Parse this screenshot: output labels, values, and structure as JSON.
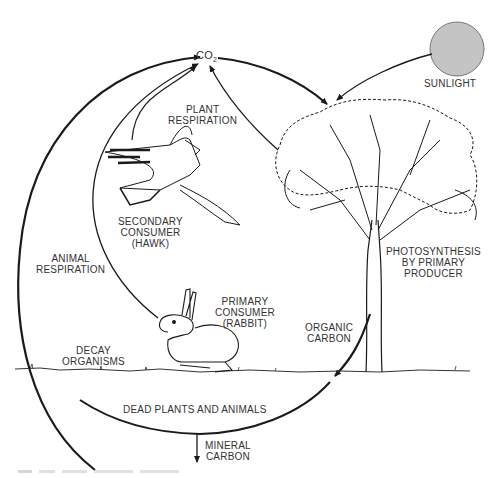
{
  "diagram": {
    "type": "carbon-cycle",
    "nodes": {
      "co2": {
        "label": "CO",
        "subscript": "2"
      },
      "sunlight": {
        "label": "SUNLIGHT",
        "color": "#c4c4c4"
      },
      "plant_respiration": {
        "line1": "PLANT",
        "line2": "RESPIRATION"
      },
      "hawk": {
        "line1": "SECONDARY",
        "line2": "CONSUMER",
        "line3": "(HAWK)"
      },
      "animal_respiration": {
        "line1": "ANIMAL",
        "line2": "RESPIRATION"
      },
      "rabbit": {
        "line1": "PRIMARY",
        "line2": "CONSUMER",
        "line3": "(RABBIT)"
      },
      "photosynthesis": {
        "line1": "PHOTOSYNTHESIS",
        "line2": "BY PRIMARY",
        "line3": "PRODUCER"
      },
      "organic_carbon": {
        "line1": "ORGANIC",
        "line2": "CARBON"
      },
      "decay": {
        "line1": "DECAY",
        "line2": "ORGANISMS"
      },
      "dead": {
        "label": "DEAD PLANTS AND ANIMALS"
      },
      "mineral_carbon": {
        "line1": "MINERAL",
        "line2": "CARBON"
      }
    },
    "edges": [
      {
        "from": "decay",
        "to": "co2",
        "label": ""
      },
      {
        "from": "hawk",
        "to": "co2",
        "label": ""
      },
      {
        "from": "rabbit",
        "to": "co2",
        "label": "ANIMAL RESPIRATION"
      },
      {
        "from": "tree",
        "to": "co2",
        "label": "PLANT RESPIRATION"
      },
      {
        "from": "co2",
        "to": "tree",
        "label": ""
      },
      {
        "from": "sunlight",
        "to": "tree",
        "label": ""
      },
      {
        "from": "tree",
        "to": "ground",
        "label": "ORGANIC CARBON"
      },
      {
        "from": "ground",
        "to": "decay",
        "label": "DEAD PLANTS AND ANIMALS"
      },
      {
        "from": "cycle",
        "to": "mineral",
        "label": "MINERAL CARBON"
      }
    ],
    "colors": {
      "line": "#1a1a1a",
      "sun": "#c4c4c4",
      "text": "#333333"
    }
  }
}
